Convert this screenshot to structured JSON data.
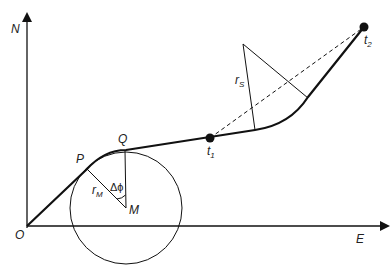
{
  "diagram": {
    "axes": {
      "y_label": "N",
      "x_label": "E",
      "origin_label": "O"
    },
    "points": {
      "P": "P",
      "Q": "Q",
      "M": "M",
      "t1": {
        "base": "t",
        "sub": "1"
      },
      "t2": {
        "base": "t",
        "sub": "2"
      }
    },
    "radius_labels": {
      "rM": {
        "base": "r",
        "sub": "M"
      },
      "rS": {
        "base": "r",
        "sub": "S"
      }
    },
    "angle_label": "Δϕ",
    "colors": {
      "stroke": "#111111",
      "background": "#ffffff"
    }
  }
}
